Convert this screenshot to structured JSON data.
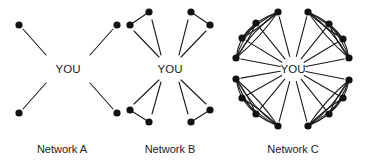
{
  "colors": {
    "ink": "#111111",
    "background": "#ffffff"
  },
  "networks": [
    {
      "id": "A",
      "label": "Network A",
      "center_label": "YOU",
      "center": [
        68,
        69
      ],
      "label_pos": [
        62,
        153
      ],
      "nodes": [
        [
          19,
          25
        ],
        [
          117,
          25
        ],
        [
          19,
          113
        ],
        [
          117,
          113
        ]
      ],
      "ties_to_you": [
        [
          [
            23,
            29
          ],
          [
            46,
            55
          ]
        ],
        [
          [
            113,
            29
          ],
          [
            90,
            55
          ]
        ],
        [
          [
            23,
            109
          ],
          [
            46,
            83
          ]
        ],
        [
          [
            113,
            109
          ],
          [
            90,
            83
          ]
        ]
      ],
      "peer_edges": []
    },
    {
      "id": "B",
      "label": "Network B",
      "center_label": "YOU",
      "center": [
        170,
        69
      ],
      "label_pos": [
        170,
        153
      ],
      "nodes": [
        [
          130,
          25
        ],
        [
          149,
          12
        ],
        [
          191,
          12
        ],
        [
          210,
          25
        ],
        [
          130,
          110
        ],
        [
          149,
          122
        ],
        [
          191,
          122
        ],
        [
          210,
          110
        ]
      ],
      "ties_to_you": [
        [
          [
            134,
            31
          ],
          [
            159,
            57
          ]
        ],
        [
          [
            152,
            20
          ],
          [
            161,
            55
          ]
        ],
        [
          [
            188,
            20
          ],
          [
            179,
            55
          ]
        ],
        [
          [
            206,
            31
          ],
          [
            181,
            57
          ]
        ],
        [
          [
            134,
            104
          ],
          [
            159,
            80
          ]
        ],
        [
          [
            152,
            114
          ],
          [
            161,
            82
          ]
        ],
        [
          [
            188,
            114
          ],
          [
            179,
            82
          ]
        ],
        [
          [
            206,
            104
          ],
          [
            181,
            80
          ]
        ]
      ],
      "peer_edges": [
        [
          [
            130,
            25
          ],
          [
            149,
            12
          ]
        ],
        [
          [
            191,
            12
          ],
          [
            210,
            25
          ]
        ],
        [
          [
            130,
            110
          ],
          [
            149,
            122
          ]
        ],
        [
          [
            191,
            122
          ],
          [
            210,
            110
          ]
        ]
      ]
    },
    {
      "id": "C",
      "label": "Network C",
      "center_label": "YOU",
      "center": [
        293,
        69
      ],
      "label_pos": [
        293,
        153
      ],
      "clusters": [
        [
          [
            278,
            12
          ],
          [
            256,
            23
          ],
          [
            242,
            38
          ],
          [
            236,
            58
          ]
        ],
        [
          [
            308,
            12
          ],
          [
            329,
            24
          ],
          [
            343,
            39
          ],
          [
            349,
            58
          ]
        ],
        [
          [
            236,
            79
          ],
          [
            242,
            98
          ],
          [
            256,
            114
          ],
          [
            278,
            126
          ]
        ],
        [
          [
            349,
            80
          ],
          [
            343,
            98
          ],
          [
            329,
            114
          ],
          [
            308,
            126
          ]
        ]
      ]
    }
  ]
}
